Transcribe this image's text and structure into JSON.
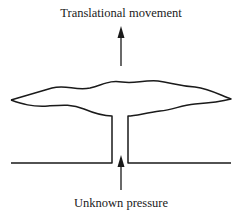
{
  "diagram": {
    "labels": {
      "top": "Translational movement",
      "bottom": "Unknown pressure"
    },
    "colors": {
      "stroke": "#1a1a1a",
      "background": "#ffffff"
    },
    "elements": [
      {
        "id": "membrane",
        "type": "wavy-plate",
        "description": "Flexible wavy membrane plate"
      },
      {
        "id": "stem",
        "type": "tube",
        "description": "Vertical connecting tube/stem"
      },
      {
        "id": "base",
        "type": "surface",
        "description": "Base surface with opening"
      },
      {
        "id": "arrow-up-top",
        "type": "arrow",
        "direction": "up"
      },
      {
        "id": "arrow-up-bottom",
        "type": "arrow",
        "direction": "up"
      }
    ]
  }
}
